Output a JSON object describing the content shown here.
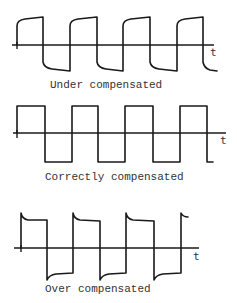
{
  "diagram": {
    "type": "square-wave compensation comparison",
    "axis_label": "t",
    "panels": [
      {
        "id": "under",
        "caption": "Under compensated",
        "shape": "rounded leading edges (rise/fall with exponential rounding, slowly approaching plateau)"
      },
      {
        "id": "correct",
        "caption": "Correctly compensated",
        "shape": "ideal square wave with flat tops and bottoms"
      },
      {
        "id": "over",
        "caption": "Over compensated",
        "shape": "overshoot spikes at each edge decaying to plateau"
      }
    ]
  },
  "colors": {
    "line": "#1a1a1a",
    "text": "#333333",
    "background": "#ffffff"
  }
}
